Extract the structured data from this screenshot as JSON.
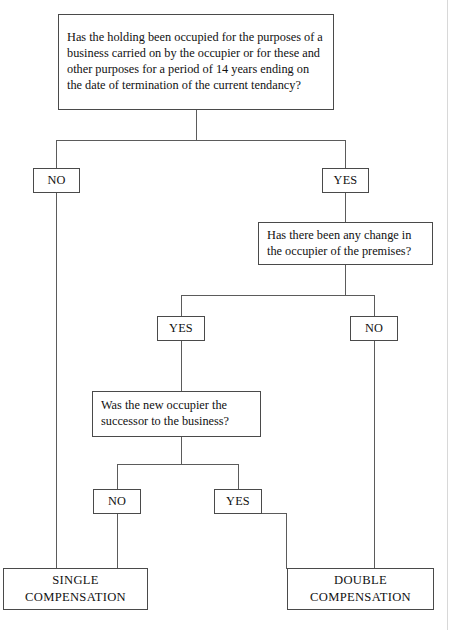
{
  "diagram": {
    "line_color": "#5b5b5b",
    "border_color": "#4a4a4a",
    "background": "#ffffff"
  },
  "nodes": {
    "q1": {
      "id": "q1",
      "type": "question",
      "text": "Has the holding been occupied for the purposes of a business carried on by the occupier or for these and other purposes for a period of 14 years ending on the date of termination of the current tendancy?",
      "lines": [
        "Has the holding been occupied for the purposes",
        "of a business carried on by the occupier or for",
        "these and other purposes for a period of",
        "14 years ending on the date of termination of",
        "the current tendancy?"
      ]
    },
    "q1_no": {
      "id": "q1_no",
      "type": "decision",
      "text": "NO"
    },
    "q1_yes": {
      "id": "q1_yes",
      "type": "decision",
      "text": "YES"
    },
    "q2": {
      "id": "q2",
      "type": "question",
      "text": "Has there been any change in the occupier of the premises?",
      "lines": [
        "Has there been any change in",
        "the occupier of the premises?"
      ]
    },
    "q2_yes": {
      "id": "q2_yes",
      "type": "decision",
      "text": "YES"
    },
    "q2_no": {
      "id": "q2_no",
      "type": "decision",
      "text": "NO"
    },
    "q3": {
      "id": "q3",
      "type": "question",
      "text": "Was the new occupier the successor to the business?",
      "lines": [
        "Was the new occupier the",
        "successor to the business?"
      ]
    },
    "q3_no": {
      "id": "q3_no",
      "type": "decision",
      "text": "NO"
    },
    "q3_yes": {
      "id": "q3_yes",
      "type": "decision",
      "text": "YES"
    },
    "single": {
      "id": "single",
      "type": "outcome",
      "text": "SINGLE COMPENSATION",
      "lines": [
        "SINGLE",
        "COMPENSATION"
      ]
    },
    "double": {
      "id": "double",
      "type": "outcome",
      "text": "DOUBLE COMPENSATION",
      "lines": [
        "DOUBLE",
        "COMPENSATION"
      ]
    }
  }
}
